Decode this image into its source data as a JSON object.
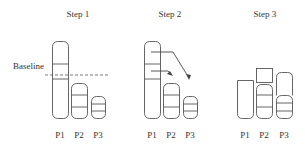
{
  "diagram": {
    "baseline_label": "Baseline",
    "steps": [
      {
        "title": "Step 1",
        "columns": [
          "P1",
          "P2",
          "P3"
        ]
      },
      {
        "title": "Step 2",
        "columns": [
          "P1",
          "P2",
          "P3"
        ]
      },
      {
        "title": "Step 3",
        "columns": [
          "P1",
          "P2",
          "P3"
        ]
      }
    ],
    "colors": {
      "stroke": "#555555",
      "text": "#333333",
      "background": "#ffffff"
    }
  }
}
